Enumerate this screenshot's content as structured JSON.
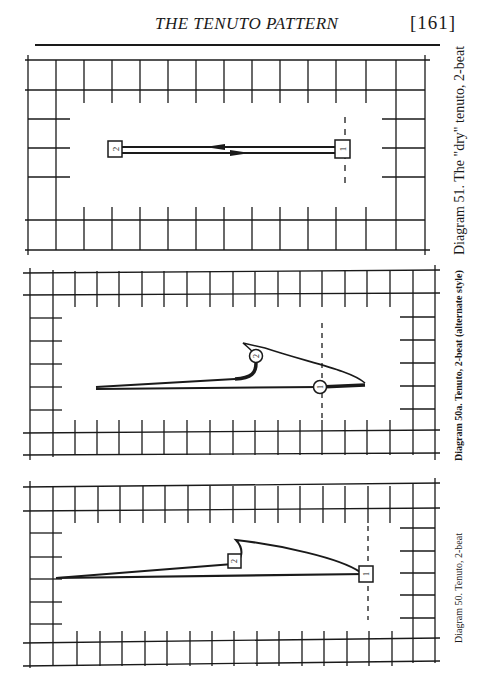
{
  "header": {
    "running_title": "THE TENUTO PATTERN",
    "page_number": "[161]"
  },
  "diagrams": [
    {
      "id": "51",
      "caption": "Diagram 51.  The \"dry\" tenuto, 2-beat",
      "marker_style": "square",
      "markers": [
        {
          "label": "1"
        },
        {
          "label": "2"
        }
      ]
    },
    {
      "id": "50a",
      "caption": "Diagram 50a. Tenuto, 2-beat (alternate style)",
      "marker_style": "circle",
      "markers": [
        {
          "label": "1"
        },
        {
          "label": "2"
        }
      ]
    },
    {
      "id": "50",
      "caption": "Diagram 50.  Tenuto, 2-beat",
      "marker_style": "square",
      "markers": [
        {
          "label": "1"
        },
        {
          "label": "2"
        }
      ]
    }
  ],
  "colors": {
    "ink": "#1a1a1a",
    "paper": "#ffffff"
  }
}
